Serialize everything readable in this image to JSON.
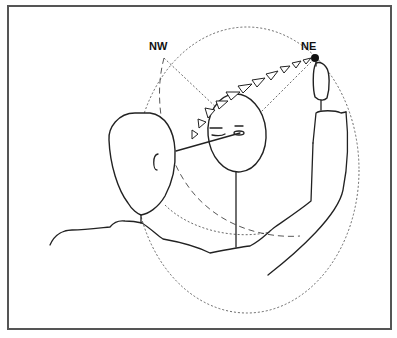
{
  "diagram": {
    "labels": {
      "nw": "NW",
      "ne": "NE"
    },
    "colors": {
      "line": "#222222",
      "frame": "#555555",
      "background": "#ffffff"
    },
    "arrow_count": 12
  }
}
